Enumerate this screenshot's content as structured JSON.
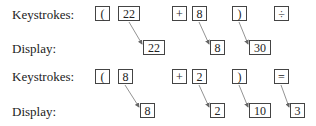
{
  "rows": [
    {
      "keystrokes_label": "Keystrokes:",
      "display_label": "Display:",
      "keys": [
        "(",
        "22",
        "+",
        "8",
        ")",
        "÷"
      ],
      "displays": [
        "22",
        "8",
        "30"
      ]
    },
    {
      "keystrokes_label": "Keystrokes:",
      "display_label": "Display:",
      "keys": [
        "(",
        "8",
        "+",
        "2",
        ")",
        "="
      ],
      "displays": [
        "8",
        "2",
        "10",
        "3"
      ]
    }
  ]
}
